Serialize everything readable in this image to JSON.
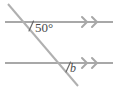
{
  "figure": {
    "type": "geometry-diagram",
    "background_color": "#ffffff",
    "line_color": "#a8a8a8",
    "transversal_color": "#b0b0b0",
    "label_color": "#4a4a4a",
    "parallel_lines": [
      {
        "name": "upper-parallel-line",
        "x1": 5,
        "y1": 22,
        "x2": 113,
        "y2": 22,
        "arrow_marks": 2,
        "arrow_direction": "right"
      },
      {
        "name": "lower-parallel-line",
        "x1": 5,
        "y1": 63,
        "x2": 113,
        "y2": 63,
        "arrow_marks": 2,
        "arrow_direction": "right"
      }
    ],
    "transversal": {
      "name": "transversal-line",
      "x1": 8,
      "y1": 4,
      "x2": 78,
      "y2": 86
    },
    "intersections": [
      {
        "name": "upper-intersection",
        "x": 25,
        "y": 22
      },
      {
        "name": "lower-intersection",
        "x": 63,
        "y": 63
      }
    ],
    "labels": [
      {
        "name": "upper-angle-label",
        "text": "50°",
        "value": 50,
        "unit": "degrees",
        "at": "upper-intersection"
      },
      {
        "name": "lower-angle-label",
        "text": "b",
        "value": null,
        "unit": "degrees",
        "at": "lower-intersection"
      }
    ],
    "angle_arcs": [
      {
        "name": "upper-angle-arc",
        "x1": 29,
        "y1": 30,
        "x2": 33,
        "y2": 22
      },
      {
        "name": "lower-angle-arc",
        "x1": 66,
        "y1": 71,
        "x2": 70,
        "y2": 63
      }
    ]
  }
}
